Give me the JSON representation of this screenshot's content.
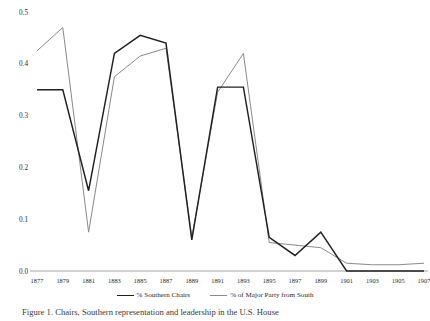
{
  "figure": {
    "caption_prefix": "Figure 1.",
    "caption_text": "Figure 1. Chairs, Southern representation and leadership in the U.S. House"
  },
  "legend": {
    "position": "bottom-center",
    "items": [
      {
        "label": "% Southern Chairs",
        "color": "#231f20",
        "style": "thick-solid"
      },
      {
        "label": "% of Major Party from South",
        "color": "#8a8a8a",
        "style": "thin-solid"
      }
    ]
  },
  "axes": {
    "y": {
      "ticks": [
        "0.0",
        "0.1",
        "0.2",
        "0.3",
        "0.4",
        "0.5"
      ],
      "min": 0.0,
      "max": 0.5,
      "step": 0.1
    },
    "x": {
      "ticks": [
        "1877",
        "1879",
        "1881",
        "1883",
        "1885",
        "1887",
        "1889",
        "1891",
        "1893",
        "1895",
        "1897",
        "1899",
        "1901",
        "1903",
        "1905",
        "1907"
      ],
      "min": 1877,
      "max": 1907,
      "step": 2
    }
  },
  "chart_data": {
    "type": "line",
    "title": "",
    "xlabel": "",
    "ylabel": "",
    "xlim": [
      1877,
      1907
    ],
    "ylim": [
      0.0,
      0.5
    ],
    "grid": false,
    "legend_position": "bottom-center",
    "categories": [
      1877,
      1879,
      1881,
      1883,
      1885,
      1887,
      1889,
      1891,
      1893,
      1895,
      1897,
      1899,
      1901,
      1903,
      1905,
      1907
    ],
    "series": [
      {
        "name": "% Southern Chairs",
        "color": "#231f20",
        "values": [
          0.35,
          0.35,
          0.155,
          0.42,
          0.455,
          0.44,
          0.06,
          0.355,
          0.355,
          0.065,
          0.03,
          0.075,
          0.0,
          0.0,
          0.0,
          0.0
        ]
      },
      {
        "name": "% of Major Party from South",
        "color": "#8a8a8a",
        "values": [
          0.425,
          0.47,
          0.075,
          0.375,
          0.415,
          0.43,
          0.065,
          0.345,
          0.42,
          0.055,
          0.05,
          0.045,
          0.015,
          0.012,
          0.012,
          0.015
        ]
      }
    ]
  }
}
